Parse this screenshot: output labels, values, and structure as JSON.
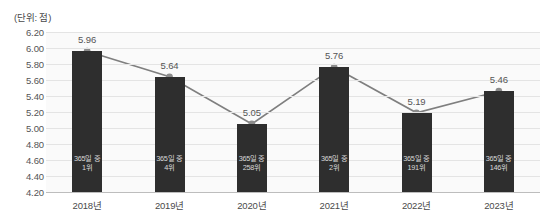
{
  "unit_label": "(단위: 점)",
  "chart_data": {
    "type": "bar",
    "title": "",
    "subtitle": "",
    "xlabel": "",
    "ylabel": "",
    "unit_note": "(단위: 점)",
    "categories": [
      "2018년",
      "2019년",
      "2020년",
      "2021년",
      "2022년",
      "2023년"
    ],
    "values": [
      5.96,
      5.64,
      5.05,
      5.76,
      5.19,
      5.46
    ],
    "value_labels": [
      "5.96",
      "5.64",
      "5.05",
      "5.76",
      "5.19",
      "5.46"
    ],
    "bar_annotations": [
      {
        "line1": "365일 중",
        "line2": "1위"
      },
      {
        "line1": "365일 중",
        "line2": "4위"
      },
      {
        "line1": "365일 중",
        "line2": "258위"
      },
      {
        "line1": "365일 중",
        "line2": "2위"
      },
      {
        "line1": "365일 중",
        "line2": "191위"
      },
      {
        "line1": "365일 중",
        "line2": "146위"
      }
    ],
    "ylim": [
      4.2,
      6.2
    ],
    "ytick_step": 0.2,
    "ytick_labels": [
      "6.20",
      "6.00",
      "5.80",
      "5.60",
      "5.40",
      "5.20",
      "5.00",
      "4.80",
      "4.60",
      "4.40",
      "4.20"
    ],
    "ytick_values": [
      6.2,
      6.0,
      5.8,
      5.6,
      5.4,
      5.2,
      5.0,
      4.8,
      4.6,
      4.4,
      4.2
    ],
    "grid": true,
    "legend": null,
    "overlay_series": {
      "name": "추이",
      "type": "line",
      "values": [
        5.96,
        5.64,
        5.05,
        5.76,
        5.19,
        5.46
      ],
      "marker": "circle"
    },
    "colors": {
      "bar": "#2e2e2e",
      "line": "#7f7f7f",
      "marker": "#8c8c8c",
      "plot_background": "#fafafa",
      "gridline": "#e4e4e4",
      "axis": "#bdbdbd",
      "tick_text": "#555555",
      "bar_label_text": "#d8d8d8"
    }
  }
}
